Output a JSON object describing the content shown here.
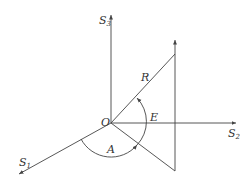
{
  "diagram": {
    "type": "coordinate-system",
    "labels": {
      "origin": "O",
      "axis1": {
        "main": "S",
        "sub": "1"
      },
      "axis2": {
        "main": "S",
        "sub": "2"
      },
      "axis3": {
        "main": "S",
        "sub": "3"
      },
      "vector": "R",
      "angle_elevation": "E",
      "angle_azimuth": "A"
    },
    "colors": {
      "stroke": "#444444",
      "text": "#333333"
    }
  }
}
